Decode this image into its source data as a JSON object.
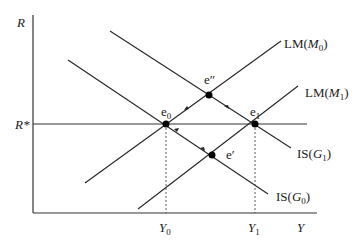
{
  "axes": {
    "y_label": "R",
    "x_label": "Y",
    "r_star_label": "R*",
    "y0_label": "Y",
    "y0_sub": "0",
    "y1_label": "Y",
    "y1_sub": "1"
  },
  "curves": {
    "lm_m0": {
      "prefix": "LM(",
      "var": "M",
      "sub": "0",
      "suffix": ")"
    },
    "lm_m1": {
      "prefix": "LM(",
      "var": "M",
      "sub": "1",
      "suffix": ")"
    },
    "is_g0": {
      "prefix": "IS(",
      "var": "G",
      "sub": "0",
      "suffix": ")"
    },
    "is_g1": {
      "prefix": "IS(",
      "var": "G",
      "sub": "1",
      "suffix": ")"
    }
  },
  "points": {
    "e0": {
      "base": "e",
      "sub": "0"
    },
    "e1": {
      "base": "e",
      "sub": "1"
    },
    "e_double_prime": {
      "base": "e",
      "mark": "″"
    },
    "e_prime": {
      "base": "e",
      "mark": "′"
    }
  },
  "colors": {
    "line": "#2a2a2a",
    "axis": "#333333"
  }
}
